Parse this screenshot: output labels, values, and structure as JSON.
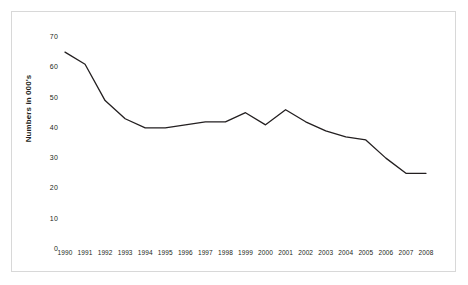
{
  "chart_data": {
    "type": "line",
    "title": "",
    "subtitle": "",
    "xlabel": "",
    "ylabel": "Numbers in 000's",
    "categories": [
      "1990",
      "1991",
      "1992",
      "1993",
      "1994",
      "1995",
      "1996",
      "1997",
      "1998",
      "1999",
      "2000",
      "2001",
      "2002",
      "2003",
      "2004",
      "2005",
      "2006",
      "2007",
      "2008"
    ],
    "values": [
      65,
      61,
      49,
      43,
      40,
      40,
      41,
      42,
      42,
      45,
      41,
      46,
      42,
      39,
      37,
      36,
      30,
      25,
      25
    ],
    "series": [
      {
        "name": "Numbers in 000's",
        "values": [
          65,
          61,
          49,
          43,
          40,
          40,
          41,
          42,
          42,
          45,
          41,
          46,
          42,
          39,
          37,
          36,
          30,
          25,
          25
        ]
      }
    ],
    "ylim": [
      0,
      70
    ],
    "y_ticks": [
      0,
      10,
      20,
      30,
      40,
      50,
      60,
      70
    ],
    "y_tick_labels": [
      "0",
      "10",
      "20",
      "30",
      "40",
      "50",
      "60",
      "70"
    ],
    "grid": false,
    "legend": false,
    "legend_position": "none",
    "line_color": "#231f20",
    "line_width": 1.3,
    "background_color": "#ffffff",
    "border_color": "#d8d8d8",
    "annotations": []
  },
  "figure": {
    "frame_label": "chart-frame"
  }
}
